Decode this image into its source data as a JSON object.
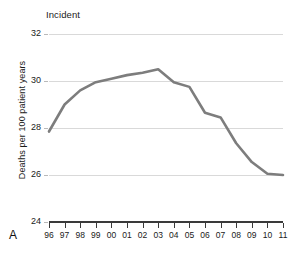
{
  "panel": {
    "letter": "A"
  },
  "chart_data": {
    "type": "line",
    "title": "Incident",
    "xlabel": "",
    "ylabel": "Deaths per 100 patient years",
    "categories": [
      "96",
      "97",
      "98",
      "99",
      "00",
      "01",
      "02",
      "03",
      "04",
      "05",
      "06",
      "07",
      "08",
      "09",
      "10",
      "11"
    ],
    "x_tick_labels": [
      "96",
      "97",
      "98",
      "99",
      "00",
      "01",
      "02",
      "03",
      "04",
      "05",
      "06",
      "07",
      "08",
      "09",
      "10",
      "11"
    ],
    "y_tick_labels": [
      "24",
      "26",
      "28",
      "30",
      "32"
    ],
    "y_ticks": [
      24,
      26,
      28,
      30,
      32
    ],
    "ylim": [
      24,
      32
    ],
    "xlim": [
      "96",
      "11"
    ],
    "grid": "horizontal",
    "legend": "none",
    "series": [
      {
        "name": "Incident",
        "color": "#7d7d7d",
        "values": [
          27.85,
          29.0,
          29.6,
          29.95,
          30.1,
          30.25,
          30.35,
          30.5,
          29.95,
          29.75,
          28.65,
          28.45,
          27.35,
          26.55,
          26.05,
          26.0
        ]
      }
    ]
  }
}
